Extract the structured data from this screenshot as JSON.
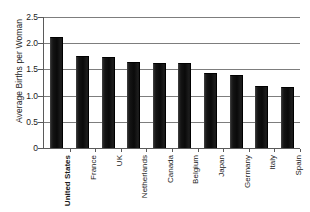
{
  "chart_data": {
    "type": "bar",
    "title": "",
    "xlabel": "",
    "ylabel": "Average Births per Woman",
    "ylim": [
      0,
      2.5
    ],
    "ytick_labels": [
      "2.5",
      "2.0",
      "1.5",
      "1.0",
      "0.5",
      "0"
    ],
    "ytick_values": [
      2.5,
      2.0,
      1.5,
      1.0,
      0.5,
      0
    ],
    "grid": "horizontal",
    "legend": "none",
    "bar_color": "#111111",
    "gridline_color": "#7d7d7d",
    "axis_color": "#5a5a5a",
    "categories": [
      "United States",
      "France",
      "UK",
      "Netherlands",
      "Canada",
      "Belgium",
      "Japan",
      "Germany",
      "Italy",
      "Spain"
    ],
    "values": [
      2.12,
      1.75,
      1.73,
      1.64,
      1.63,
      1.62,
      1.43,
      1.39,
      1.19,
      1.16
    ],
    "emphasized_category": "United States",
    "points": [
      {
        "category": "United States",
        "value": 2.12
      },
      {
        "category": "France",
        "value": 1.75
      },
      {
        "category": "UK",
        "value": 1.73
      },
      {
        "category": "Netherlands",
        "value": 1.64
      },
      {
        "category": "Canada",
        "value": 1.63
      },
      {
        "category": "Belgium",
        "value": 1.62
      },
      {
        "category": "Japan",
        "value": 1.43
      },
      {
        "category": "Germany",
        "value": 1.39
      },
      {
        "category": "Italy",
        "value": 1.19
      },
      {
        "category": "Spain",
        "value": 1.16
      }
    ]
  }
}
